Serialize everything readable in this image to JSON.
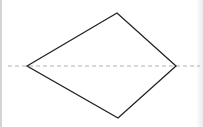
{
  "diagram": {
    "shape": "kite",
    "vertices": {
      "left": [
        27,
        66
      ],
      "top": [
        117,
        13
      ],
      "right": [
        176,
        66
      ],
      "bottom": [
        118,
        118
      ]
    },
    "axis_line": {
      "style": "dashed",
      "y": 66,
      "x1": 8,
      "x2": 200,
      "color": "#b0b0b0"
    },
    "stroke_color": "#222222"
  }
}
